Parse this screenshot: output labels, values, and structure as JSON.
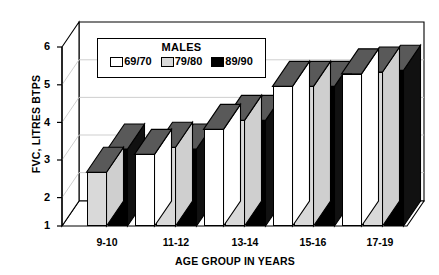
{
  "chart_data": {
    "type": "bar",
    "title": "",
    "legend_title": "MALES",
    "legend_position": "top-left-inside",
    "grid": true,
    "style": "3d-grouped-bar",
    "categories": [
      "9-10",
      "11-12",
      "13-14",
      "15-16",
      "17-19"
    ],
    "series": [
      {
        "name": "69/70",
        "color": "#ffffff",
        "values": [
          null,
          3.0,
          3.7,
          4.9,
          5.25
        ]
      },
      {
        "name": "79/80",
        "color": "#d9d9d9",
        "values": [
          2.5,
          3.2,
          3.95,
          4.9,
          5.3
        ]
      },
      {
        "name": "89/90",
        "color": "#000000",
        "values": [
          3.15,
          3.15,
          3.95,
          4.9,
          5.35
        ]
      }
    ],
    "xlabel": "AGE GROUP IN YEARS",
    "ylabel": "FVC, LITRES BTPS",
    "ylim": [
      1,
      6
    ],
    "yticks": [
      "1",
      "2",
      "3",
      "4",
      "5",
      "6"
    ],
    "xticks": [
      "9-10",
      "11-12",
      "13-14",
      "15-16",
      "17-19"
    ]
  },
  "colors": {
    "background": "#ffffff",
    "axis": "#000000",
    "grid": "#c9c9c9",
    "series_69_70": "#ffffff",
    "series_79_80": "#d9d9d9",
    "series_89_90": "#000000",
    "top_face": "#595959",
    "side_face": "#8c8c8c"
  }
}
